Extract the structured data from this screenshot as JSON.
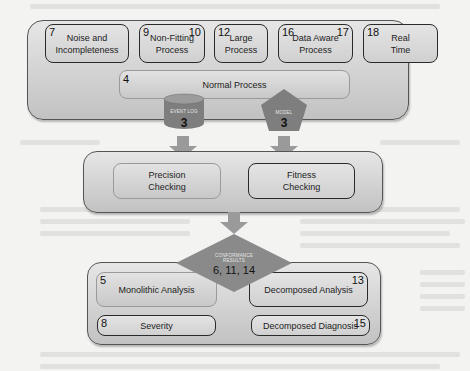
{
  "diagram": {
    "top_container": {
      "boxes": [
        {
          "label": "Noise and Incompleteness",
          "numbers_left": "7",
          "numbers_right": ""
        },
        {
          "label": "Non-Fitting Process",
          "numbers_left": "9",
          "numbers_right": "10"
        },
        {
          "label": "Large Process",
          "numbers_left": "12",
          "numbers_right": ""
        },
        {
          "label": "Data Aware Process",
          "numbers_left": "16",
          "numbers_right": "17"
        },
        {
          "label": "Real Time",
          "numbers_left": "18",
          "numbers_right": ""
        }
      ],
      "normal_process": {
        "label": "Normal Process",
        "number": "4"
      }
    },
    "inputs": {
      "event_log": {
        "label": "EVENT LOG",
        "number": "3",
        "shape": "cylinder"
      },
      "model": {
        "label": "MODEL",
        "number": "3",
        "shape": "pentagon"
      }
    },
    "checking_container": {
      "precision": {
        "label": "Precision Checking"
      },
      "fitness": {
        "label": "Fitness Checking"
      }
    },
    "conformance_results": {
      "label": "CONFORMANCE RESULTS",
      "numbers": "6, 11, 14",
      "shape": "diamond"
    },
    "analysis_container": {
      "monolithic": {
        "label": "Monolithic Analysis",
        "number": "5"
      },
      "decomposed_analysis": {
        "label": "Decomposed Analysis",
        "number": "13"
      },
      "severity": {
        "label": "Severity",
        "number": "8"
      },
      "decomposed_diagnosis": {
        "label": "Decomposed Diagnosis",
        "number": "15"
      }
    },
    "colors": {
      "container_fill": "#d2d2d2",
      "box_border": "#2a2a2a",
      "shape_fill": "#8a8a8a",
      "arrow_fill": "#9a9a9a"
    }
  }
}
